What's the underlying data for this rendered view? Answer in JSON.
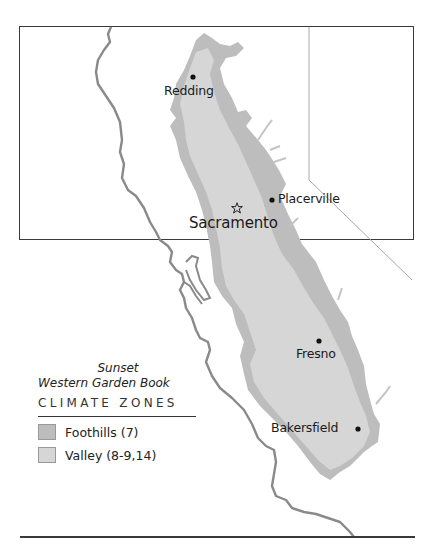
{
  "map": {
    "colors": {
      "foothills": "#bdbdbd",
      "valley": "#d6d6d6",
      "coastline": "#8a8a8a",
      "border": "#9a9a9a",
      "frame": "#3a3a3a"
    },
    "cities": [
      {
        "name": "Redding",
        "marker": "dot",
        "x": 193,
        "y": 77
      },
      {
        "name": "Placerville",
        "marker": "dot",
        "x": 272,
        "y": 200
      },
      {
        "name": "Sacramento",
        "marker": "star",
        "x": 237,
        "y": 208,
        "capital": true
      },
      {
        "name": "Fresno",
        "marker": "dot",
        "x": 319,
        "y": 341
      },
      {
        "name": "Bakersfield",
        "marker": "dot",
        "x": 358,
        "y": 429
      }
    ]
  },
  "legend": {
    "publisher": "Sunset",
    "book": "Western Garden Book",
    "heading": "CLIMATE ZONES",
    "items": [
      {
        "label": "Foothills (7)",
        "color": "#bdbdbd"
      },
      {
        "label": "Valley (8-9,14)",
        "color": "#d6d6d6"
      }
    ]
  }
}
